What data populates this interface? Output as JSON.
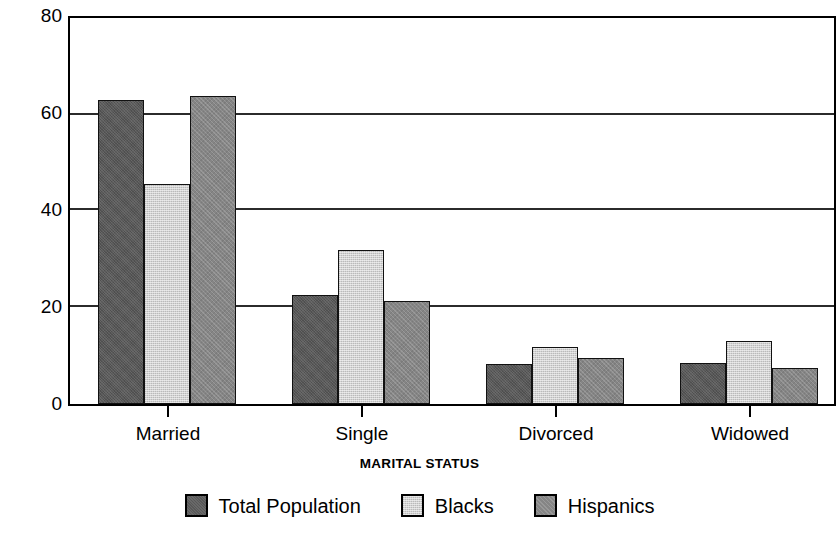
{
  "chart_data": {
    "type": "bar",
    "title": "",
    "xlabel": "MARITAL STATUS",
    "ylabel": "PROPORTION OF THE POPULATION",
    "categories": [
      "Married",
      "Single",
      "Divorced",
      "Widowed"
    ],
    "series": [
      {
        "name": "Total Population",
        "color": "#585858",
        "values": [
          63.0,
          22.5,
          8.2,
          8.4
        ]
      },
      {
        "name": "Blacks",
        "color": "#d2d2d2",
        "values": [
          45.5,
          32.0,
          11.8,
          13.0
        ]
      },
      {
        "name": "Hispanics",
        "color": "#858585",
        "values": [
          63.8,
          21.4,
          9.6,
          7.4
        ]
      }
    ],
    "ylim": [
      0,
      80
    ],
    "yticks": [
      0,
      20,
      40,
      60,
      80
    ],
    "ytick_labels": [
      "0",
      "20",
      "40",
      "60",
      "80"
    ],
    "grid": true,
    "grid_axis": "y",
    "legend_position": "bottom"
  },
  "axis": {
    "y_title": "PROPORTION OF THE POPULATION",
    "x_title": "MARITAL STATUS"
  },
  "legend": {
    "items": [
      {
        "label": "Total Population",
        "swatch": "#585858"
      },
      {
        "label": "Blacks",
        "swatch": "#d2d2d2"
      },
      {
        "label": "Hispanics",
        "swatch": "#858585"
      }
    ]
  }
}
